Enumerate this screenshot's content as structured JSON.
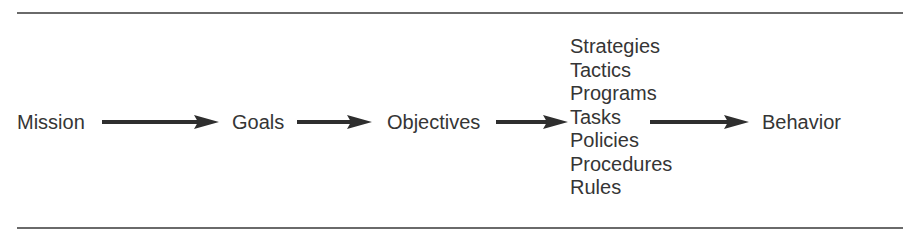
{
  "diagram": {
    "type": "flow",
    "direction": "left-to-right",
    "nodes": [
      {
        "id": "mission",
        "label": "Mission"
      },
      {
        "id": "goals",
        "label": "Goals"
      },
      {
        "id": "objectives",
        "label": "Objectives"
      },
      {
        "id": "means",
        "labels": [
          "Strategies",
          "Tactics",
          "Programs",
          "Tasks",
          "Policies",
          "Procedures",
          "Rules"
        ]
      },
      {
        "id": "behavior",
        "label": "Behavior"
      }
    ],
    "edges": [
      {
        "from": "mission",
        "to": "goals"
      },
      {
        "from": "goals",
        "to": "objectives"
      },
      {
        "from": "objectives",
        "to": "means"
      },
      {
        "from": "means",
        "to": "behavior"
      }
    ],
    "colors": {
      "text": "#353535",
      "arrow": "#2e2e2e",
      "rule": "#6a6a6a"
    }
  },
  "labels": {
    "mission": "Mission",
    "goals": "Goals",
    "objectives": "Objectives",
    "behavior": "Behavior",
    "stack": [
      "Strategies",
      "Tactics",
      "Programs",
      "Tasks",
      "Policies",
      "Procedures",
      "Rules"
    ]
  }
}
